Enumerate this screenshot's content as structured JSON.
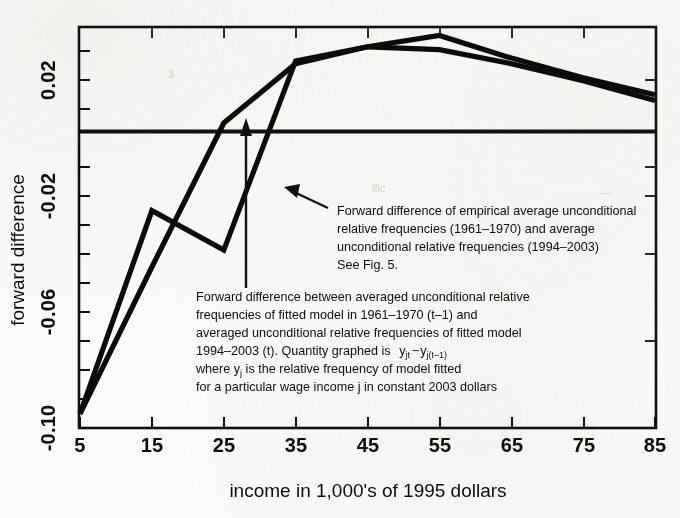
{
  "figure": {
    "title": "",
    "background_color": "#fbfbf9",
    "ink_color": "#0d0d0d"
  },
  "axes": {
    "x_title": "income in 1,000's of 1995 dollars",
    "y_title": "forward difference",
    "x_ticks": [
      "5",
      "15",
      "25",
      "35",
      "45",
      "55",
      "65",
      "75",
      "85"
    ],
    "y_ticks": [
      "0.02",
      "-0.02",
      "-0.06",
      "-0.10"
    ]
  },
  "annotations": {
    "empirical": {
      "name": "empirical-series-annotation",
      "lines": [
        "Forward difference of empirical average unconditional",
        "relative frequencies (1961–1970) and average",
        "unconditional relative frequencies (1994–2003)",
        "See Fig. 5."
      ]
    },
    "fitted": {
      "name": "fitted-model-annotation",
      "lines": [
        "Forward difference between averaged unconditional relative",
        "frequencies of fitted model in 1961–1970 (t–1) and",
        "averaged unconditional relative frequencies of fitted model",
        "1994–2003 (t). Quantity graphed is",
        "where y",
        "for a particular wage income j in constant 2003 dollars"
      ],
      "formula_main": "y",
      "formula_sub_1": "jt",
      "formula_minus": "−",
      "formula_main_2": "y",
      "formula_sub_2": "j(t–1)",
      "line5_a": "where y",
      "line5_sub": "j",
      "line5_b": " is the relative frequency of model fitted"
    }
  },
  "chart_data": {
    "type": "line",
    "title": "",
    "xlabel": "income in 1,000's of 1995 dollars",
    "ylabel": "forward difference",
    "xlim": [
      5,
      85
    ],
    "ylim": [
      -0.105,
      0.037
    ],
    "grid": false,
    "legend": "none (inline text annotations)",
    "x": [
      5,
      15,
      25,
      35,
      45,
      55,
      65,
      75,
      85
    ],
    "series": [
      {
        "name": "Forward difference of empirical average unconditional relative frequencies (1961–1970) and average unconditional relative frequencies (1994–2003)",
        "values": [
          -0.1,
          -0.028,
          -0.042,
          0.025,
          0.03,
          0.034,
          0.026,
          0.019,
          0.013
        ]
      },
      {
        "name": "Forward difference between averaged unconditional relative frequencies of fitted model 1961–1970 (t–1) and 1994–2003 (t)",
        "values": [
          -0.1,
          -0.048,
          0.003,
          0.024,
          0.03,
          0.029,
          0.024,
          0.018,
          0.011
        ]
      }
    ],
    "reference_line": {
      "y": 0.0,
      "style": "solid-heavy"
    }
  },
  "ghost_text": {
    "a": "3",
    "b": "ific",
    "c": "—"
  }
}
